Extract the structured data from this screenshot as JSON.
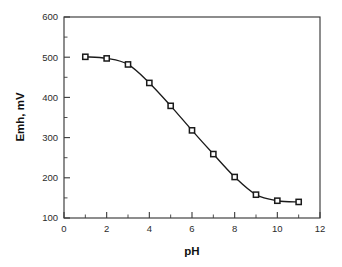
{
  "chart_data": {
    "type": "line",
    "title": "",
    "subtitle": "",
    "xlabel": "pH",
    "ylabel": "Emh, mV",
    "xlim": [
      0,
      12
    ],
    "ylim": [
      100,
      600
    ],
    "grid": false,
    "legend": null,
    "marker": "open-square",
    "x": [
      1,
      2,
      3,
      4,
      5,
      6,
      7,
      8,
      9,
      10,
      11
    ],
    "values": [
      501,
      497,
      482,
      436,
      379,
      318,
      259,
      202,
      158,
      143,
      140
    ],
    "series": [
      {
        "name": "Emh",
        "x": [
          1,
          2,
          3,
          4,
          5,
          6,
          7,
          8,
          9,
          10,
          11
        ],
        "values": [
          501,
          497,
          482,
          436,
          379,
          318,
          259,
          202,
          158,
          143,
          140
        ]
      }
    ],
    "x_ticks": [
      0,
      2,
      4,
      6,
      8,
      10,
      12
    ],
    "x_tick_labels": [
      "0",
      "2",
      "4",
      "6",
      "8",
      "10",
      "12"
    ],
    "x_minor_ticks": [
      1,
      3,
      5,
      7,
      9,
      11
    ],
    "y_ticks": [
      100,
      200,
      300,
      400,
      500,
      600
    ],
    "y_tick_labels": [
      "100",
      "200",
      "300",
      "400",
      "500",
      "600"
    ],
    "y_minor_ticks": [
      150,
      250,
      350,
      450,
      550
    ],
    "colors": {
      "line": "#1a1a1a",
      "marker_fill": "#ffffff",
      "marker_edge": "#1a1a1a",
      "axis": "#3a3a3a",
      "text": "#111111",
      "background": "#ffffff"
    }
  }
}
